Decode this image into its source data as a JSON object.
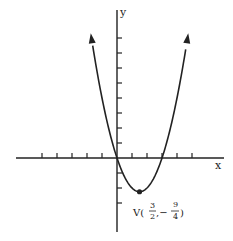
{
  "chart_data": {
    "type": "line",
    "title": "",
    "xlabel": "x",
    "ylabel": "y",
    "equation": "y = x^2 - 3x",
    "series": [
      {
        "name": "parabola",
        "x": [
          -1.75,
          -1.5,
          -1,
          -0.5,
          0,
          0.5,
          1,
          1.5,
          2,
          2.5,
          3,
          3.5,
          4,
          4.5,
          4.75
        ],
        "y": [
          8.31,
          6.75,
          4,
          1.75,
          0,
          -1.25,
          -2,
          -2.25,
          -2,
          -1.25,
          0,
          1.75,
          4,
          6.75,
          8.31
        ]
      }
    ],
    "annotations": [
      {
        "text": "V(3/2, -9/4)",
        "x": 1.5,
        "y": -2.25,
        "type": "vertex-point"
      }
    ],
    "xlim": [
      -6.7,
      7.2
    ],
    "ylim": [
      -5,
      8.6
    ],
    "x_ticks": [
      -5,
      -4,
      -3,
      -2,
      -1,
      1,
      2,
      3,
      4,
      5
    ],
    "y_ticks": [
      -3,
      -2,
      -1,
      1,
      2,
      3,
      4,
      5,
      6,
      7,
      8
    ],
    "grid": false,
    "legend": "none"
  },
  "labels": {
    "x_axis": "x",
    "y_axis": "y",
    "vertex_prefix": "V(",
    "vertex_x_num": "3",
    "vertex_x_den": "2",
    "vertex_sep": ",−",
    "vertex_y_num": "9",
    "vertex_y_den": "4",
    "vertex_suffix": ")"
  },
  "colors": {
    "ink": "#222222",
    "background": "#ffffff"
  }
}
